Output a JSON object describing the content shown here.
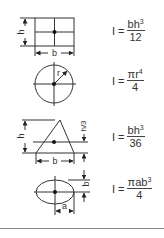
{
  "shapes": [
    {
      "name": "rectangle",
      "dimension_labels": {
        "height": "h",
        "width": "b"
      },
      "formula": {
        "lhs": "I =",
        "numerator": "bh",
        "exponent": "3",
        "denominator": "12"
      }
    },
    {
      "name": "circle",
      "dimension_labels": {
        "radius": "r"
      },
      "formula": {
        "lhs": "I =",
        "numerator": "πr",
        "exponent": "4",
        "denominator": "4"
      }
    },
    {
      "name": "triangle",
      "dimension_labels": {
        "height": "h",
        "width": "b",
        "centroid_offset": "h/3"
      },
      "formula": {
        "lhs": "I =",
        "numerator": "bh",
        "exponent": "3",
        "denominator": "36"
      }
    },
    {
      "name": "ellipse",
      "dimension_labels": {
        "semi_major": "a",
        "semi_minor": "b"
      },
      "formula": {
        "lhs": "I =",
        "numerator": "πab",
        "exponent": "3",
        "denominator": "4"
      }
    }
  ],
  "colors": {
    "line": "#333333",
    "background": "#ffffff",
    "rule": "#888888"
  }
}
